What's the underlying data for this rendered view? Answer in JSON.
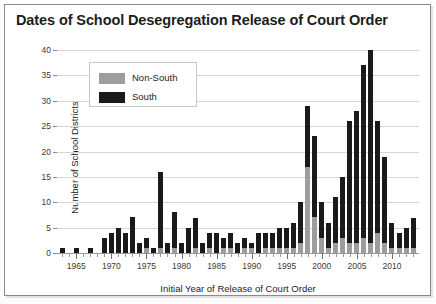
{
  "chart_data": {
    "type": "bar",
    "title": "Dates of School Desegregation Release of Court Order",
    "xlabel": "Initial Year of Release of Court Order",
    "ylabel": "Number of School Districts",
    "ylim": [
      0,
      40
    ],
    "ytick_labels": [
      "0",
      "5",
      "10",
      "15",
      "20",
      "25",
      "30",
      "35",
      "40"
    ],
    "yticks": [
      0,
      5,
      10,
      15,
      20,
      25,
      30,
      35,
      40
    ],
    "xtick_labels": [
      "1965",
      "1970",
      "1975",
      "1980",
      "1985",
      "1990",
      "1995",
      "2000",
      "2005",
      "2010"
    ],
    "xticks": [
      1965,
      1970,
      1975,
      1980,
      1985,
      1990,
      1995,
      2000,
      2005,
      2010
    ],
    "grid": "horizontal",
    "stacked": true,
    "legend_position": "upper-left-inside",
    "legend": [
      {
        "name": "Non-South",
        "color": "#9d9d9d"
      },
      {
        "name": "South",
        "color": "#1a1a1a"
      }
    ],
    "categories": [
      1963,
      1964,
      1965,
      1966,
      1967,
      1968,
      1969,
      1970,
      1971,
      1972,
      1973,
      1974,
      1975,
      1976,
      1977,
      1978,
      1979,
      1980,
      1981,
      1982,
      1983,
      1984,
      1985,
      1986,
      1987,
      1988,
      1989,
      1990,
      1991,
      1992,
      1993,
      1994,
      1995,
      1996,
      1997,
      1998,
      1999,
      2000,
      2001,
      2002,
      2003,
      2004,
      2005,
      2006,
      2007,
      2008,
      2009,
      2010,
      2011,
      2012,
      2013
    ],
    "series": [
      {
        "name": "Non-South",
        "color": "#9d9d9d",
        "values": [
          0,
          0,
          0,
          0,
          0,
          0,
          0,
          0,
          0,
          0,
          0,
          0,
          1,
          0,
          1,
          0,
          1,
          0,
          0,
          1,
          0,
          1,
          0,
          1,
          1,
          0,
          1,
          1,
          0,
          1,
          1,
          1,
          1,
          1,
          2,
          17,
          7,
          3,
          1,
          2,
          3,
          2,
          2,
          3,
          2,
          4,
          2,
          1,
          1,
          1,
          1
        ]
      },
      {
        "name": "South",
        "color": "#1a1a1a",
        "values": [
          1,
          0,
          1,
          0,
          1,
          0,
          3,
          4,
          5,
          4,
          7,
          2,
          2,
          1,
          15,
          2,
          7,
          2,
          5,
          6,
          2,
          3,
          4,
          2,
          3,
          2,
          2,
          1,
          4,
          3,
          3,
          4,
          4,
          5,
          8,
          12,
          16,
          7,
          5,
          9,
          12,
          24,
          26,
          34,
          38,
          22,
          17,
          5,
          3,
          4,
          6
        ]
      }
    ],
    "totals": [
      1,
      0,
      1,
      0,
      1,
      0,
      3,
      4,
      5,
      4,
      7,
      2,
      3,
      1,
      16,
      2,
      8,
      2,
      5,
      7,
      2,
      4,
      4,
      3,
      4,
      2,
      3,
      2,
      4,
      4,
      4,
      5,
      5,
      6,
      10,
      29,
      23,
      10,
      6,
      11,
      15,
      26,
      28,
      37,
      40,
      26,
      19,
      6,
      4,
      5,
      7
    ]
  }
}
